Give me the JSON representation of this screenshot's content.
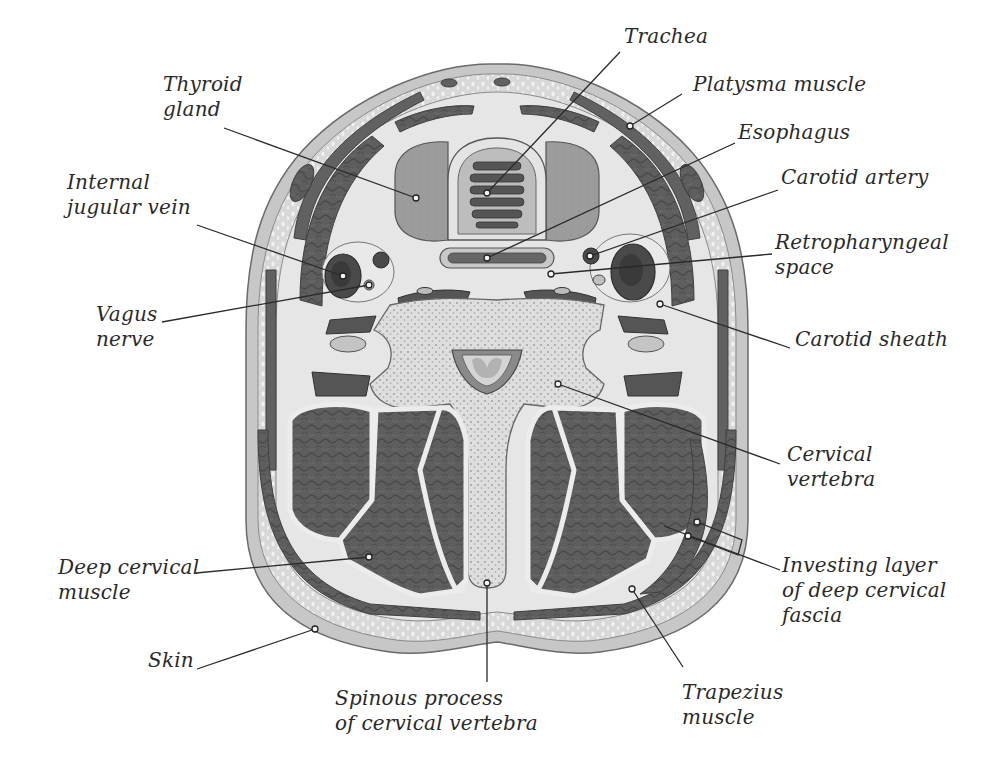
{
  "figure": {
    "colors": {
      "background": "#ffffff",
      "skin": "#c9c9c9",
      "subcutaneous": "#dcdcdc",
      "muscle": "#5c5c5c",
      "muscle_light": "#777777",
      "fascia": "#ececec",
      "bone": "#d6d6d6",
      "gland": "#9a9a9a",
      "vessel_dark": "#3a3a3a",
      "text": "#2a2a2a"
    }
  },
  "labels": [
    {
      "id": "thyroid-gland",
      "text": "Thyroid\ngland",
      "x": 163,
      "y": 72,
      "anchor": "left",
      "line": [
        [
          224,
          128
        ],
        [
          416,
          198
        ]
      ]
    },
    {
      "id": "trachea",
      "text": "Trachea",
      "x": 624,
      "y": 24,
      "anchor": "left",
      "line": [
        [
          620,
          52
        ],
        [
          487,
          193
        ]
      ]
    },
    {
      "id": "platysma-muscle",
      "text": "Platysma muscle",
      "x": 693,
      "y": 72,
      "anchor": "left",
      "line": [
        [
          682,
          94
        ],
        [
          630,
          126
        ]
      ]
    },
    {
      "id": "esophagus",
      "text": "Esophagus",
      "x": 738,
      "y": 120,
      "anchor": "left",
      "line": [
        [
          735,
          143
        ],
        [
          487,
          258
        ]
      ]
    },
    {
      "id": "internal-jugular-vein",
      "text": "Internal\njugular vein",
      "x": 67,
      "y": 170,
      "anchor": "left",
      "line": [
        [
          197,
          225
        ],
        [
          343,
          276
        ]
      ]
    },
    {
      "id": "carotid-artery",
      "text": "Carotid artery",
      "x": 781,
      "y": 165,
      "anchor": "left",
      "line": [
        [
          778,
          190
        ],
        [
          590,
          256
        ]
      ]
    },
    {
      "id": "retropharyngeal-space",
      "text": "Retropharyngeal\nspace",
      "x": 775,
      "y": 230,
      "anchor": "left",
      "line": [
        [
          772,
          254
        ],
        [
          551,
          274
        ]
      ]
    },
    {
      "id": "vagus-nerve",
      "text": "Vagus\nnerve",
      "x": 96,
      "y": 302,
      "anchor": "left",
      "line": [
        [
          162,
          322
        ],
        [
          369,
          285
        ]
      ]
    },
    {
      "id": "carotid-sheath",
      "text": "Carotid sheath",
      "x": 795,
      "y": 327,
      "anchor": "left",
      "line": [
        [
          790,
          348
        ],
        [
          660,
          304
        ]
      ]
    },
    {
      "id": "cervical-vertebra",
      "text": "Cervical\nvertebra",
      "x": 787,
      "y": 442,
      "anchor": "left",
      "line": [
        [
          780,
          464
        ],
        [
          558,
          384
        ]
      ]
    },
    {
      "id": "deep-cervical-muscle",
      "text": "Deep cervical\nmuscle",
      "x": 58,
      "y": 555,
      "anchor": "left",
      "line": [
        [
          196,
          573
        ],
        [
          369,
          557
        ]
      ]
    },
    {
      "id": "investing-layer",
      "text": "Investing layer\nof deep cervical\nfascia",
      "x": 782,
      "y": 553,
      "anchor": "left",
      "line": [
        [
          780,
          570
        ],
        [
          664,
          526
        ]
      ],
      "bracket": [
        [
          697,
          522
        ],
        [
          742,
          540
        ],
        [
          738,
          555
        ],
        [
          688,
          536
        ]
      ]
    },
    {
      "id": "skin",
      "text": "Skin",
      "x": 148,
      "y": 648,
      "anchor": "left",
      "line": [
        [
          197,
          669
        ],
        [
          315,
          629
        ]
      ]
    },
    {
      "id": "spinous-process",
      "text": "Spinous process\nof cervical vertebra",
      "x": 335,
      "y": 686,
      "anchor": "left",
      "line": [
        [
          487,
          682
        ],
        [
          487,
          583
        ]
      ]
    },
    {
      "id": "trapezius-muscle",
      "text": "Trapezius\nmuscle",
      "x": 682,
      "y": 680,
      "anchor": "left",
      "line": [
        [
          683,
          667
        ],
        [
          632,
          589
        ]
      ]
    }
  ]
}
